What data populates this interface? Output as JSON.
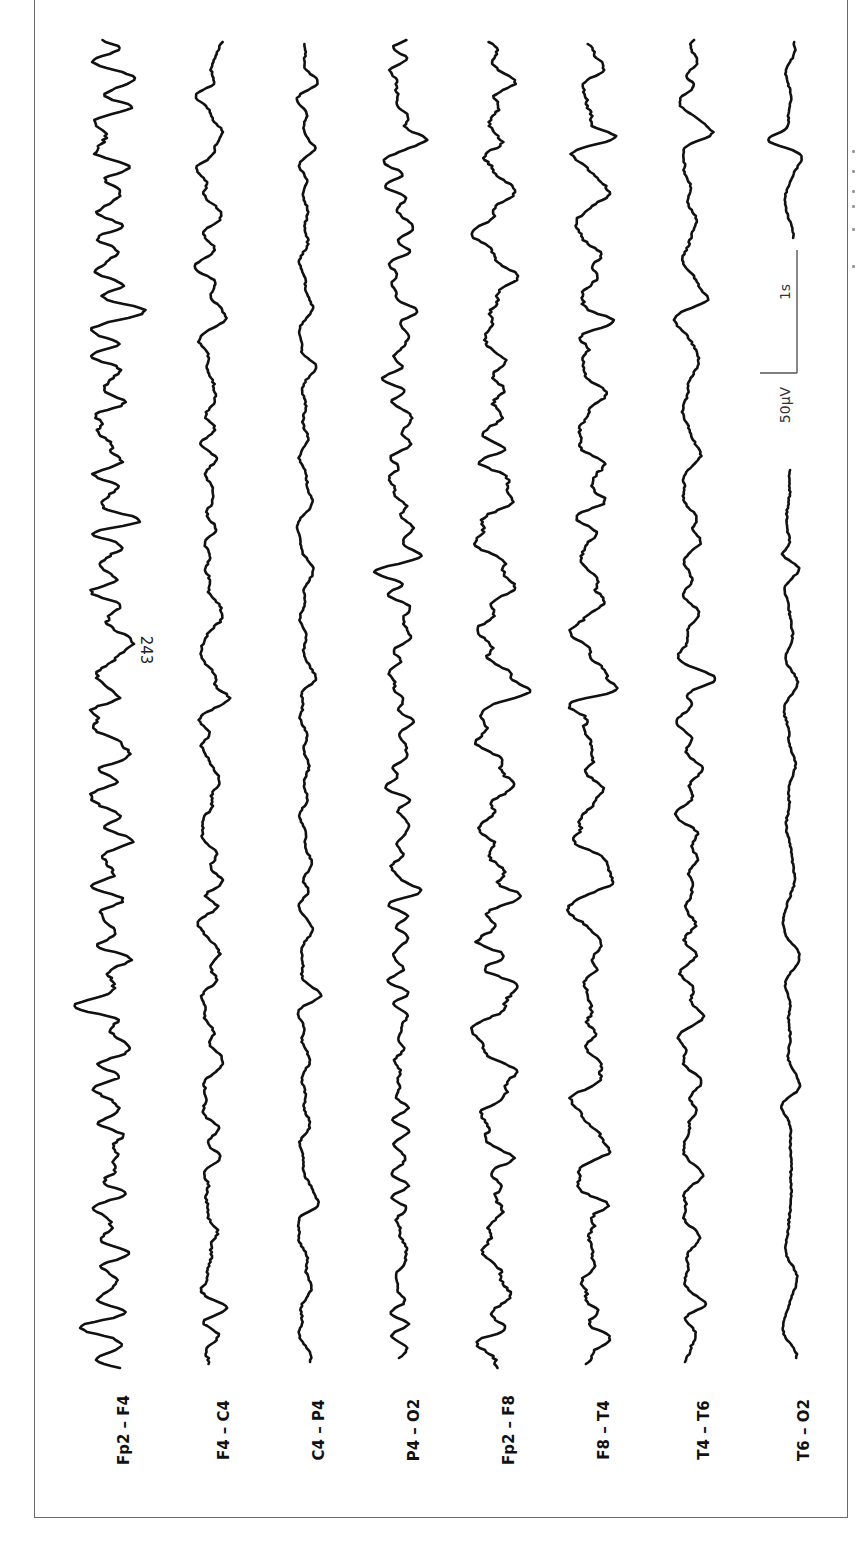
{
  "figure": {
    "frame": {
      "left": 34,
      "top": -2,
      "width": 814,
      "height": 1520,
      "border_color": "#6a6a6a"
    },
    "orientation": "rotated-90-ccw",
    "trace_color": "#111111",
    "trace_start_y": 40,
    "trace_end_y": 1368
  },
  "channels": [
    {
      "label": "Fp2 – F4",
      "x": 110,
      "amp": 11,
      "seed": 11,
      "spikes": [
        [
          1330,
          -22
        ],
        [
          1150,
          18
        ],
        [
          1010,
          -14
        ],
        [
          725,
          -28
        ],
        [
          650,
          30
        ],
        [
          520,
          16
        ],
        [
          430,
          -22
        ],
        [
          312,
          20
        ],
        [
          78,
          14
        ]
      ]
    },
    {
      "label": "F4 – C4",
      "x": 210,
      "amp": 7,
      "seed": 23,
      "spikes": [
        [
          1310,
          12
        ],
        [
          1070,
          10
        ],
        [
          905,
          12
        ],
        [
          695,
          15
        ],
        [
          620,
          14
        ],
        [
          320,
          12
        ],
        [
          85,
          14
        ],
        [
          230,
          -10
        ]
      ]
    },
    {
      "label": "C4 – P4",
      "x": 305,
      "amp": 5,
      "seed": 37,
      "spikes": [
        [
          1205,
          14
        ],
        [
          995,
          10
        ],
        [
          890,
          8
        ],
        [
          680,
          10
        ],
        [
          365,
          10
        ],
        [
          150,
          8
        ],
        [
          83,
          10
        ]
      ]
    },
    {
      "label": "P4 – O2",
      "x": 400,
      "amp": 6,
      "seed": 41,
      "spikes": [
        [
          1255,
          10
        ],
        [
          890,
          22
        ],
        [
          760,
          12
        ],
        [
          555,
          20
        ],
        [
          140,
          22
        ],
        [
          310,
          10
        ]
      ]
    },
    {
      "label": "Fp2 – F8",
      "x": 495,
      "amp": 10,
      "seed": 53,
      "spikes": [
        [
          1330,
          20
        ],
        [
          1160,
          14
        ],
        [
          955,
          18
        ],
        [
          895,
          16
        ],
        [
          690,
          28
        ],
        [
          450,
          18
        ],
        [
          320,
          16
        ],
        [
          145,
          20
        ],
        [
          85,
          14
        ]
      ]
    },
    {
      "label": "F8 – T4",
      "x": 590,
      "amp": 9,
      "seed": 67,
      "spikes": [
        [
          1310,
          18
        ],
        [
          1205,
          22
        ],
        [
          1030,
          14
        ],
        [
          885,
          18
        ],
        [
          690,
          22
        ],
        [
          500,
          18
        ],
        [
          320,
          16
        ],
        [
          137,
          20
        ],
        [
          195,
          16
        ]
      ]
    },
    {
      "label": "T4 – T6",
      "x": 690,
      "amp": 6,
      "seed": 79,
      "spikes": [
        [
          1305,
          14
        ],
        [
          1130,
          10
        ],
        [
          880,
          12
        ],
        [
          680,
          14
        ],
        [
          540,
          12
        ],
        [
          300,
          14
        ],
        [
          135,
          16
        ],
        [
          85,
          12
        ]
      ]
    },
    {
      "label": "T6 – O2",
      "x": 790,
      "amp": 4,
      "seed": 97,
      "gap": [
        238,
        470
      ],
      "spikes": [
        [
          555,
          -14
        ],
        [
          140,
          -22
        ],
        [
          1090,
          6
        ]
      ]
    }
  ],
  "labels_y": 1430,
  "annotation": {
    "text": "243",
    "x": 146,
    "y": 650
  },
  "scale_bar": {
    "time_label": "1s",
    "amplitude_label": "50µV",
    "vertical": {
      "x": 797,
      "y1": 250,
      "y2": 373
    },
    "horizontal": {
      "y": 373,
      "x1": 760,
      "x2": 797
    },
    "time_label_pos": {
      "x": 785,
      "y": 292
    },
    "amp_label_pos": {
      "x": 785,
      "y": 405
    },
    "color": "#555555"
  },
  "caption_fragments": [
    [
      852,
      150
    ],
    [
      852,
      170
    ],
    [
      852,
      190
    ],
    [
      852,
      205
    ],
    [
      852,
      228
    ],
    [
      852,
      265
    ]
  ]
}
